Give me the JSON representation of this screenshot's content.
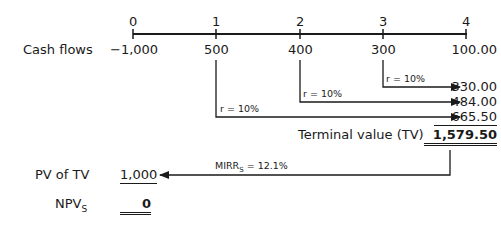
{
  "timeline": {
    "periods": [
      "0",
      "1",
      "2",
      "3",
      "4"
    ]
  },
  "cash_flows": {
    "label": "Cash flows",
    "values": [
      "−1,000",
      "500",
      "400",
      "300",
      "100.00"
    ]
  },
  "compounding": {
    "rate_labels": [
      "r = 10%",
      "r = 10%",
      "r = 10%"
    ],
    "future_values": [
      "330.00",
      "484.00",
      "665.50"
    ]
  },
  "terminal_value": {
    "label": "Terminal value (TV)",
    "value": "1,579.50"
  },
  "discounting": {
    "rate_label_prefix": "MIRR",
    "rate_label_sub": "S",
    "rate_label_suffix": " = 12.1%"
  },
  "pv_of_tv": {
    "label": "PV of TV",
    "value": "1,000"
  },
  "npv": {
    "label_prefix": "NPV",
    "label_sub": "S",
    "value": "0"
  },
  "colors": {
    "ink": "#1a1a1a",
    "background": "#ffffff"
  }
}
